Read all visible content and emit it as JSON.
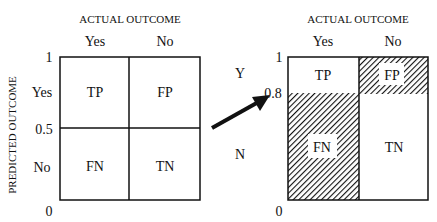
{
  "left_matrix": {
    "column_header": "ACTUAL OUTCOME",
    "row_header": "PREDICTED OUTCOME",
    "columns": [
      "Yes",
      "No"
    ],
    "rows": [
      "Yes",
      "No"
    ],
    "y_ticks": [
      "1",
      "0.5",
      "0"
    ],
    "cells": {
      "tp": "TP",
      "fp": "FP",
      "fn": "FN",
      "tn": "TN"
    },
    "threshold": 0.5
  },
  "right_matrix": {
    "column_header": "ACTUAL OUTCOME",
    "columns": [
      "Yes",
      "No"
    ],
    "rows": [
      "Y",
      "N"
    ],
    "y_ticks": [
      "1",
      "0.8",
      "0"
    ],
    "cells": {
      "tp": "TP",
      "fp": "FP",
      "fn": "FN",
      "tn": "TN"
    },
    "threshold": 0.8,
    "hatched_cells": [
      "FP",
      "FN"
    ]
  },
  "arrow": {
    "direction": "left-to-right",
    "meaning": "threshold shift"
  },
  "colors": {
    "line": "#111111",
    "background": "#ffffff"
  }
}
